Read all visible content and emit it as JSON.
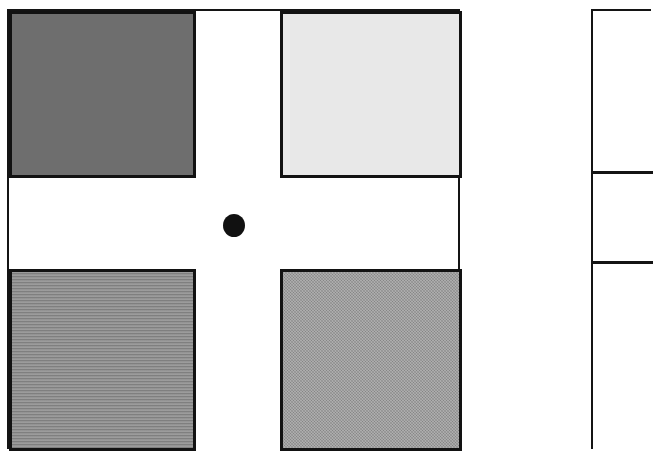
{
  "figure": {
    "caption": "",
    "background_color": "#ffffff",
    "frame_color": "#141414",
    "canvas": {
      "width": 624,
      "height": 427
    }
  },
  "quadrant_panel": {
    "name": "quadrant-panel",
    "border_color": "#141414",
    "gap_color": "#ffffff",
    "quadrants": [
      {
        "position": "top-left",
        "label": "",
        "fill_color": "#6e6e6e",
        "texture": "solid",
        "border_color": "#121212"
      },
      {
        "position": "top-right",
        "label": "",
        "fill_color": "#e8e8e8",
        "texture": "solid",
        "border_color": "#121212"
      },
      {
        "position": "bottom-left",
        "label": "",
        "fill_color": "#8d8d8d",
        "texture": "horizontal-lines",
        "border_color": "#121212"
      },
      {
        "position": "bottom-right",
        "label": "",
        "fill_color": "#9a9a9a",
        "texture": "stipple-noise",
        "border_color": "#121212"
      }
    ],
    "center_marker": {
      "label": "",
      "shape": "circle",
      "fill_color": "#111111",
      "diameter_px": 22
    }
  },
  "side_table": {
    "name": "side-table",
    "border_color": "#141414",
    "cropped": true,
    "cells": [
      {
        "label": ""
      },
      {
        "label": ""
      },
      {
        "label": ""
      }
    ]
  }
}
